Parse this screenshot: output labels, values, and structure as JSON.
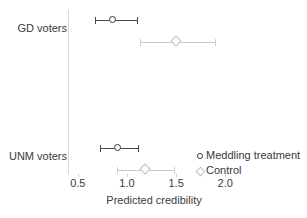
{
  "chart_data": {
    "type": "scatter",
    "title": "",
    "xlabel": "Predicted credibility",
    "ylabel": "",
    "xlim": [
      0.4,
      2.15
    ],
    "xticks": [
      0.5,
      1.0,
      1.5,
      2.0
    ],
    "xtick_labels": [
      "0.5",
      "1.0",
      "1.5",
      "2.0"
    ],
    "grid": false,
    "legend_position": "bottom-right",
    "categories": [
      "GD voters",
      "UNM voters"
    ],
    "series": [
      {
        "name": "Meddling treatment",
        "marker": "circle",
        "color": "#3a3a3a",
        "values": [
          0.86,
          0.91
        ],
        "ci_low": [
          0.67,
          0.73
        ],
        "ci_high": [
          1.1,
          1.11
        ]
      },
      {
        "name": "Control",
        "marker": "diamond",
        "color": "#c2c2c2",
        "values": [
          1.5,
          1.19
        ],
        "ci_low": [
          1.13,
          0.9
        ],
        "ci_high": [
          1.9,
          1.48
        ]
      }
    ],
    "points": [
      {
        "category": "GD voters",
        "series": "Meddling treatment",
        "x": 0.86,
        "ci_low": 0.67,
        "ci_high": 1.1
      },
      {
        "category": "GD voters",
        "series": "Control",
        "x": 1.5,
        "ci_low": 1.13,
        "ci_high": 1.9
      },
      {
        "category": "UNM voters",
        "series": "Meddling treatment",
        "x": 0.91,
        "ci_low": 0.73,
        "ci_high": 1.11
      },
      {
        "category": "UNM voters",
        "series": "Control",
        "x": 1.19,
        "ci_low": 0.9,
        "ci_high": 1.48
      }
    ]
  },
  "axis": {
    "x_title": "Predicted credibility",
    "ticks": [
      {
        "label": "0.5"
      },
      {
        "label": "1.0"
      },
      {
        "label": "1.5"
      },
      {
        "label": "2.0"
      }
    ]
  },
  "categories": [
    {
      "label": "GD voters"
    },
    {
      "label": "UNM voters"
    }
  ],
  "legend": {
    "entries": [
      {
        "label": "Meddling treatment",
        "marker": "circle-marker-icon"
      },
      {
        "label": "Control",
        "marker": "diamond-marker-icon"
      }
    ]
  }
}
